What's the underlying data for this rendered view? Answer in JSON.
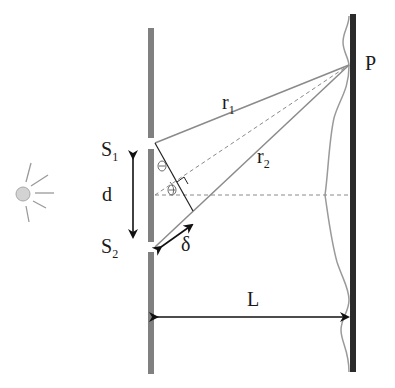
{
  "diagram": {
    "labels": {
      "s1": "S",
      "s1_sub": "1",
      "s2": "S",
      "s2_sub": "2",
      "d": "d",
      "delta": "δ",
      "r1": "r",
      "r1_sub": "1",
      "r2": "r",
      "r2_sub": "2",
      "p": "P",
      "L": "L",
      "theta": "Θ"
    },
    "colors": {
      "barrier": "#808080",
      "screen": "#2b2b2b",
      "ray": "#8a8a8a",
      "arrow": "#111111",
      "source_fill": "#d3d3d3",
      "intensity_curve": "#9a9a9a"
    }
  }
}
